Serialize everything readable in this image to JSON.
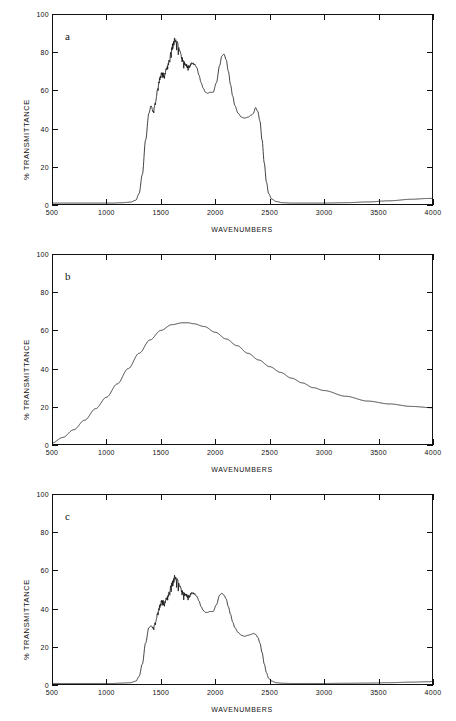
{
  "figure": {
    "background": "#ffffff",
    "ink_color": "#111111",
    "panel_count": 3
  },
  "axes_common": {
    "xlabel": "WAVENUMBERS",
    "ylabel": "% TRANSMITTANCE",
    "xticks": [
      500,
      1000,
      1500,
      2000,
      2500,
      3000,
      3500,
      4000
    ],
    "xtick_labels": [
      "500",
      "1000",
      "1500",
      "2000",
      "2500",
      "3000",
      "3500",
      "4000"
    ],
    "yticks": [
      0,
      20,
      40,
      60,
      80,
      100
    ],
    "ytick_labels": [
      "0",
      "20",
      "40",
      "60",
      "80",
      "100"
    ],
    "xlim": [
      500,
      4000
    ],
    "ylim": [
      0,
      100
    ],
    "grid": false,
    "legend": "none"
  },
  "panels": [
    {
      "id": "a",
      "label": "a"
    },
    {
      "id": "b",
      "label": "b"
    },
    {
      "id": "c",
      "label": "c"
    }
  ],
  "chart_data": [
    {
      "type": "line",
      "title": "a",
      "xlabel": "WAVENUMBERS",
      "ylabel": "% TRANSMITTANCE",
      "xlim": [
        500,
        4000
      ],
      "ylim": [
        0,
        100
      ],
      "grid": false,
      "legend": "none",
      "noisy_band": [
        1400,
        1950
      ],
      "series": [
        {
          "name": "a",
          "x": [
            500,
            700,
            900,
            1050,
            1150,
            1220,
            1270,
            1300,
            1330,
            1360,
            1390,
            1410,
            1430,
            1450,
            1470,
            1490,
            1510,
            1530,
            1550,
            1570,
            1590,
            1610,
            1630,
            1650,
            1670,
            1690,
            1710,
            1730,
            1750,
            1770,
            1790,
            1810,
            1830,
            1850,
            1870,
            1890,
            1910,
            1930,
            1950,
            1980,
            2010,
            2040,
            2060,
            2080,
            2100,
            2120,
            2140,
            2160,
            2180,
            2210,
            2240,
            2270,
            2300,
            2330,
            2350,
            2370,
            2390,
            2410,
            2430,
            2450,
            2470,
            2490,
            2520,
            2560,
            2620,
            2700,
            2800,
            2900,
            3000,
            3200,
            3400,
            3600,
            3800,
            3950,
            4000
          ],
          "y": [
            1.0,
            1.0,
            1.0,
            1.0,
            1.2,
            1.5,
            2.5,
            6.0,
            16.0,
            34.0,
            48.0,
            52.0,
            49.0,
            54.0,
            61.0,
            67.0,
            70.0,
            69.0,
            72.0,
            76.0,
            80.0,
            85.0,
            88.0,
            86.0,
            82.0,
            79.0,
            76.0,
            74.0,
            73.0,
            74.0,
            75.0,
            74.0,
            72.0,
            68.0,
            64.0,
            61.0,
            59.0,
            58.5,
            59.0,
            59.0,
            64.0,
            73.0,
            78.0,
            79.0,
            76.0,
            70.0,
            63.0,
            57.0,
            52.0,
            48.0,
            46.0,
            45.5,
            46.0,
            47.0,
            48.0,
            51.0,
            49.0,
            44.0,
            34.0,
            22.0,
            12.0,
            6.0,
            3.0,
            1.8,
            1.2,
            1.0,
            1.0,
            1.0,
            1.0,
            1.2,
            1.6,
            2.2,
            3.0,
            3.4,
            3.5
          ]
        }
      ]
    },
    {
      "type": "line",
      "title": "b",
      "xlabel": "WAVENUMBERS",
      "ylabel": "% TRANSMITTANCE",
      "xlim": [
        500,
        4000
      ],
      "ylim": [
        0,
        100
      ],
      "grid": false,
      "legend": "none",
      "noisy_band": null,
      "series": [
        {
          "name": "b",
          "x": [
            500,
            600,
            700,
            800,
            900,
            1000,
            1100,
            1200,
            1300,
            1400,
            1500,
            1600,
            1700,
            1750,
            1800,
            1900,
            2000,
            2100,
            2200,
            2300,
            2400,
            2500,
            2600,
            2700,
            2800,
            2900,
            3000,
            3200,
            3400,
            3600,
            3800,
            4000
          ],
          "y": [
            1.0,
            4.0,
            8.0,
            13.0,
            19.0,
            25.0,
            32.0,
            40.0,
            48.0,
            55.0,
            60.0,
            63.0,
            64.0,
            64.0,
            63.5,
            62.0,
            59.0,
            55.5,
            52.0,
            48.0,
            44.5,
            41.0,
            38.0,
            35.0,
            32.5,
            30.0,
            28.5,
            25.5,
            23.0,
            21.5,
            20.2,
            19.5
          ]
        }
      ]
    },
    {
      "type": "line",
      "title": "c",
      "xlabel": "WAVENUMBERS",
      "ylabel": "% TRANSMITTANCE",
      "xlim": [
        500,
        4000
      ],
      "ylim": [
        0,
        100
      ],
      "grid": false,
      "legend": "none",
      "noisy_band": [
        1400,
        1950
      ],
      "series": [
        {
          "name": "c",
          "x": [
            500,
            700,
            900,
            1050,
            1150,
            1220,
            1270,
            1300,
            1330,
            1360,
            1390,
            1410,
            1430,
            1450,
            1470,
            1490,
            1510,
            1530,
            1550,
            1570,
            1590,
            1610,
            1630,
            1650,
            1670,
            1690,
            1710,
            1730,
            1750,
            1770,
            1790,
            1810,
            1830,
            1850,
            1870,
            1890,
            1910,
            1930,
            1950,
            1980,
            2010,
            2040,
            2060,
            2080,
            2100,
            2120,
            2140,
            2160,
            2180,
            2210,
            2240,
            2270,
            2300,
            2330,
            2350,
            2370,
            2390,
            2410,
            2430,
            2450,
            2470,
            2490,
            2520,
            2560,
            2620,
            2700,
            2800,
            2900,
            3000,
            3200,
            3400,
            3600,
            3800,
            3950,
            4000
          ],
          "y": [
            0.8,
            0.8,
            0.8,
            0.8,
            1.0,
            1.2,
            2.0,
            4.5,
            11.0,
            22.0,
            30.0,
            31.0,
            30.0,
            33.0,
            38.0,
            42.0,
            45.0,
            44.0,
            46.0,
            49.0,
            52.0,
            55.0,
            58.0,
            56.0,
            53.0,
            51.0,
            49.0,
            48.0,
            47.0,
            48.0,
            49.0,
            48.0,
            46.5,
            44.0,
            41.0,
            39.0,
            38.0,
            38.0,
            38.5,
            38.5,
            42.0,
            47.0,
            48.0,
            47.0,
            45.0,
            41.0,
            37.0,
            33.0,
            30.0,
            27.5,
            26.0,
            25.5,
            26.0,
            26.5,
            27.0,
            26.5,
            25.0,
            22.0,
            17.0,
            11.0,
            6.5,
            3.5,
            2.0,
            1.2,
            0.9,
            0.8,
            0.8,
            0.8,
            0.8,
            0.9,
            1.0,
            1.2,
            1.5,
            1.7,
            1.8
          ]
        }
      ]
    }
  ]
}
